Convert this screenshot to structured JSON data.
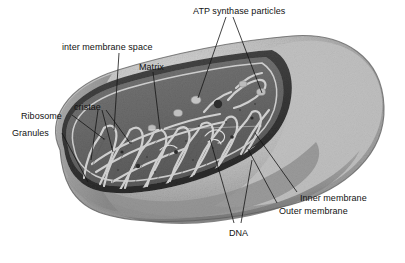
{
  "figure": {
    "background_color": "#ffffff",
    "label_color": "#121212",
    "leader_line_color": "#1a1a1a",
    "palette": {
      "outer_surface_light": "#c9c9c9",
      "outer_surface_mid": "#9d9d9d",
      "outer_surface_shadow": "#7f7f7f",
      "cut_edge_dark": "#3a3a3a",
      "matrix_gray": "#6d6d6d",
      "matrix_dark": "#555555",
      "cristae_light": "#cfcfcf",
      "cristae_highlight": "#e6e6e6",
      "granule_dark": "#2e2e2e"
    }
  },
  "labels": [
    {
      "id": "atp-synthase-particles",
      "text": "ATP synthase particles",
      "x": 193,
      "y": 6
    },
    {
      "id": "inter-membrane-space",
      "text": "inter membrane space",
      "x": 62,
      "y": 42
    },
    {
      "id": "matrix",
      "text": "Matrix",
      "x": 139,
      "y": 62
    },
    {
      "id": "cristae",
      "text": "cristae",
      "x": 74,
      "y": 102
    },
    {
      "id": "ribosome",
      "text": "Ribosome",
      "x": 21,
      "y": 111
    },
    {
      "id": "granules",
      "text": "Granules",
      "x": 12,
      "y": 128
    },
    {
      "id": "inner-membrane",
      "text": "Inner membrane",
      "x": 300,
      "y": 193
    },
    {
      "id": "outer-membrane",
      "text": "Outer membrane",
      "x": 279,
      "y": 206
    },
    {
      "id": "dna",
      "text": "DNA",
      "x": 229,
      "y": 228
    }
  ],
  "leader_lines": [
    {
      "id": "atp-left",
      "from": [
        226,
        17
      ],
      "to": [
        198,
        98
      ]
    },
    {
      "id": "atp-right",
      "from": [
        233,
        17
      ],
      "to": [
        262,
        93
      ]
    },
    {
      "id": "inter-membrane",
      "from": [
        119,
        53
      ],
      "to": [
        114,
        130
      ]
    },
    {
      "id": "matrix",
      "from": [
        153,
        72
      ],
      "to": [
        160,
        130
      ]
    },
    {
      "id": "cristae-1",
      "from": [
        98,
        110
      ],
      "to": [
        91,
        160
      ]
    },
    {
      "id": "cristae-2",
      "from": [
        102,
        110
      ],
      "to": [
        113,
        152
      ]
    },
    {
      "id": "cristae-3",
      "from": [
        106,
        110
      ],
      "to": [
        130,
        143
      ]
    },
    {
      "id": "ribosome",
      "from": [
        72,
        115
      ],
      "to": [
        104,
        139
      ]
    },
    {
      "id": "granules",
      "from": [
        62,
        133
      ],
      "to": [
        88,
        182
      ]
    },
    {
      "id": "inner-membrane",
      "from": [
        297,
        192
      ],
      "to": [
        255,
        133
      ]
    },
    {
      "id": "outer-membrane",
      "from": [
        277,
        203
      ],
      "to": [
        248,
        149
      ]
    },
    {
      "id": "dna-1",
      "from": [
        234,
        223
      ],
      "to": [
        210,
        139
      ]
    },
    {
      "id": "dna-2",
      "from": [
        241,
        223
      ],
      "to": [
        252,
        160
      ]
    }
  ],
  "structures": [
    {
      "id": "outer-membrane-body",
      "name": "outer membrane"
    },
    {
      "id": "inner-membrane-body",
      "name": "inner membrane"
    },
    {
      "id": "matrix-region",
      "name": "matrix"
    },
    {
      "id": "cristae-folds",
      "name": "cristae"
    },
    {
      "id": "atp-synthase-knobs",
      "name": "ATP synthase particles"
    },
    {
      "id": "dna-strands",
      "name": "mitochondrial DNA"
    },
    {
      "id": "ribosome-dots",
      "name": "ribosomes"
    },
    {
      "id": "granule-dots",
      "name": "granules"
    }
  ]
}
